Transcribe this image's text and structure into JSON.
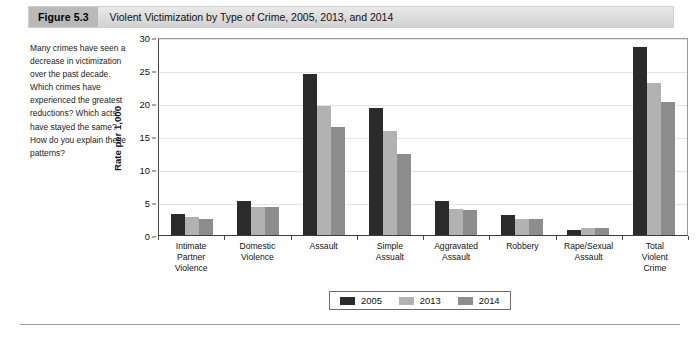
{
  "figure": {
    "tag": "Figure 5.3",
    "title": "Violent Victimization by Type of Crime, 2005, 2013, and 2014"
  },
  "caption": {
    "text": "Many crimes have seen a decrease in victimization over the past decade. Which crimes have experienced the greatest reductions? Which acts have stayed the same? How do you explain these patterns?"
  },
  "colors": {
    "series_2005": "#2b2b2b",
    "series_2013": "#b2b2b2",
    "series_2014": "#8d8d8d",
    "grid": "#e4e4e4",
    "axis": "#3c3c3c",
    "header_bar": "#dcdcdc",
    "header_tag": "#b9b9b9"
  },
  "chart_data": {
    "type": "bar",
    "title": "Violent Victimization by Type of Crime, 2005, 2013, and 2014",
    "xlabel": "",
    "ylabel": "Rate per 1,000",
    "ylim": [
      0,
      30
    ],
    "yticks": [
      0,
      5,
      10,
      15,
      20,
      25,
      30
    ],
    "ytick_labels": [
      "0",
      "5",
      "10",
      "15",
      "20",
      "25",
      "30"
    ],
    "grid": true,
    "legend_position": "bottom-center",
    "categories": [
      "Intimate Partner Violence",
      "Domestic Violence",
      "Assault",
      "Simple Assualt",
      "Aggravated Assault",
      "Robbery",
      "Rape/Sexual Assault",
      "Total Violent Crime"
    ],
    "category_lines": [
      [
        "Intimate",
        "Partner",
        "Violence"
      ],
      [
        "Domestic",
        "Violence"
      ],
      [
        "Assault"
      ],
      [
        "Simple",
        "Assualt"
      ],
      [
        "Aggravated",
        "Assault"
      ],
      [
        "Robbery"
      ],
      [
        "Rape/Sexual",
        "Assault"
      ],
      [
        "Total",
        "Violent",
        "Crime"
      ]
    ],
    "series": [
      {
        "name": "2005",
        "color": "#2b2b2b",
        "values": [
          3.2,
          5.2,
          24.4,
          19.2,
          5.1,
          3.0,
          0.8,
          28.5
        ]
      },
      {
        "name": "2013",
        "color": "#b2b2b2",
        "values": [
          2.7,
          4.3,
          19.5,
          15.7,
          4.0,
          2.4,
          1.1,
          23.1
        ]
      },
      {
        "name": "2014",
        "color": "#8d8d8d",
        "values": [
          2.4,
          4.2,
          16.4,
          12.3,
          3.8,
          2.4,
          1.1,
          20.1
        ]
      }
    ]
  },
  "legend": {
    "items": [
      {
        "label": "2005",
        "series": "s2005"
      },
      {
        "label": "2013",
        "series": "s2013"
      },
      {
        "label": "2014",
        "series": "s2014"
      }
    ]
  }
}
